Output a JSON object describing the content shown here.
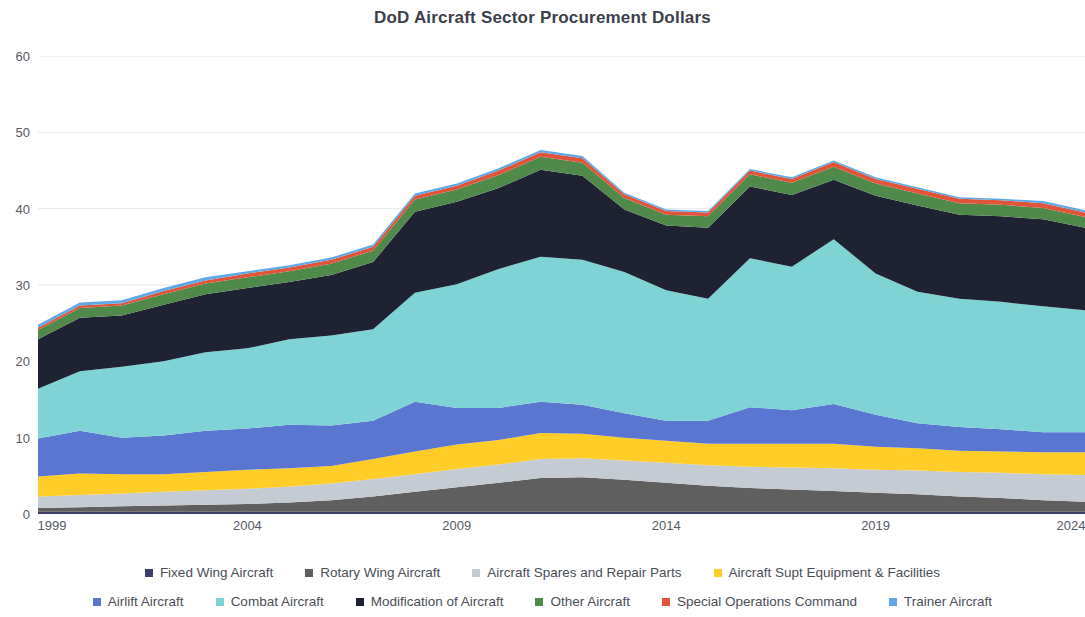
{
  "chart_data": {
    "type": "area",
    "stacked": true,
    "title": "DoD Aircraft Sector Procurement Dollars",
    "xlabel": "",
    "ylabel": "",
    "xlim": [
      1999,
      2024
    ],
    "ylim": [
      0,
      60
    ],
    "ytick_step": 10,
    "grid": true,
    "grid_axis": "y",
    "legend_position": "bottom",
    "x": [
      1999,
      2000,
      2001,
      2002,
      2003,
      2004,
      2005,
      2006,
      2007,
      2008,
      2009,
      2010,
      2011,
      2012,
      2013,
      2014,
      2015,
      2016,
      2017,
      2018,
      2019,
      2020,
      2021,
      2022,
      2023,
      2024
    ],
    "xticks": [
      "1999",
      "2004",
      "2009",
      "2014",
      "2019",
      "2024"
    ],
    "yticks": [
      "0",
      "10",
      "20",
      "30",
      "40",
      "50",
      "60"
    ],
    "series": [
      {
        "name": "Fixed Wing Aircraft",
        "color": "#3E3E6B",
        "values": [
          0.3,
          0.3,
          0.3,
          0.3,
          0.3,
          0.3,
          0.3,
          0.3,
          0.3,
          0.3,
          0.3,
          0.3,
          0.3,
          0.3,
          0.3,
          0.3,
          0.3,
          0.3,
          0.3,
          0.3,
          0.3,
          0.3,
          0.3,
          0.3,
          0.3,
          0.3
        ]
      },
      {
        "name": "Rotary Wing Aircraft",
        "color": "#5F5F5F",
        "values": [
          0.5,
          0.6,
          0.7,
          0.8,
          0.9,
          1.0,
          1.2,
          1.5,
          2.0,
          2.6,
          3.2,
          3.8,
          4.4,
          4.5,
          4.2,
          3.8,
          3.4,
          3.1,
          2.9,
          2.7,
          2.5,
          2.3,
          2.0,
          1.8,
          1.5,
          1.3
        ]
      },
      {
        "name": "Aircraft Spares and Repair Parts",
        "color": "#C5CBD2",
        "values": [
          1.5,
          1.6,
          1.7,
          1.8,
          1.9,
          2.0,
          2.1,
          2.2,
          2.3,
          2.3,
          2.4,
          2.4,
          2.5,
          2.5,
          2.5,
          2.6,
          2.7,
          2.8,
          2.9,
          3.0,
          3.0,
          3.1,
          3.2,
          3.3,
          3.4,
          3.5
        ]
      },
      {
        "name": "Aircraft Supt Equipment & Facilities",
        "color": "#FFCC28",
        "values": [
          2.6,
          2.8,
          2.5,
          2.3,
          2.4,
          2.5,
          2.4,
          2.3,
          2.6,
          3.0,
          3.2,
          3.2,
          3.4,
          3.2,
          3.0,
          2.9,
          2.8,
          3.0,
          3.1,
          3.2,
          3.0,
          2.9,
          2.8,
          2.8,
          2.9,
          3.0
        ]
      },
      {
        "name": "Airlift Aircraft",
        "color": "#5B76D0",
        "values": [
          5.0,
          5.6,
          4.8,
          5.1,
          5.4,
          5.4,
          5.7,
          5.3,
          5.0,
          6.5,
          4.8,
          4.2,
          4.1,
          3.8,
          3.2,
          2.6,
          3.0,
          4.8,
          4.4,
          5.2,
          4.2,
          3.3,
          3.1,
          2.9,
          2.6,
          2.6
        ]
      },
      {
        "name": "Combat Aircraft",
        "color": "#7ED4D4",
        "values": [
          6.5,
          7.8,
          9.3,
          9.7,
          10.3,
          10.5,
          11.2,
          11.8,
          12.0,
          14.3,
          16.2,
          18.2,
          19.0,
          19.0,
          18.5,
          17.1,
          16.0,
          19.5,
          18.8,
          21.6,
          18.5,
          17.2,
          16.8,
          16.7,
          16.5,
          16.0
        ]
      },
      {
        "name": "Modification of Aircraft",
        "color": "#1E2233",
        "values": [
          6.5,
          7.0,
          6.7,
          7.4,
          7.6,
          7.9,
          7.5,
          7.9,
          8.8,
          10.6,
          10.8,
          10.6,
          11.4,
          11.0,
          8.2,
          8.5,
          9.3,
          9.4,
          9.4,
          7.8,
          10.2,
          11.3,
          11.0,
          11.2,
          11.4,
          10.8
        ]
      },
      {
        "name": "Other Aircraft",
        "color": "#4F8A4A",
        "values": [
          1.2,
          1.3,
          1.3,
          1.4,
          1.4,
          1.4,
          1.4,
          1.5,
          1.5,
          1.6,
          1.6,
          1.7,
          1.7,
          1.7,
          1.5,
          1.4,
          1.5,
          1.6,
          1.6,
          1.7,
          1.6,
          1.6,
          1.5,
          1.5,
          1.5,
          1.4
        ]
      },
      {
        "name": "Special Operations Command",
        "color": "#E0553A",
        "values": [
          0.3,
          0.3,
          0.3,
          0.4,
          0.4,
          0.5,
          0.5,
          0.5,
          0.5,
          0.5,
          0.5,
          0.6,
          0.6,
          0.6,
          0.5,
          0.5,
          0.5,
          0.5,
          0.5,
          0.6,
          0.6,
          0.6,
          0.6,
          0.6,
          0.6,
          0.6
        ]
      },
      {
        "name": "Trainer Aircraft",
        "color": "#5FA8E8",
        "values": [
          0.4,
          0.4,
          0.4,
          0.4,
          0.4,
          0.3,
          0.3,
          0.3,
          0.3,
          0.3,
          0.3,
          0.3,
          0.3,
          0.3,
          0.2,
          0.2,
          0.2,
          0.2,
          0.2,
          0.2,
          0.2,
          0.2,
          0.2,
          0.2,
          0.3,
          0.3
        ]
      }
    ]
  },
  "legend": {
    "row1": [
      {
        "label": "Fixed Wing Aircraft",
        "color": "#3E3E6B"
      },
      {
        "label": "Rotary Wing Aircraft",
        "color": "#5F5F5F"
      },
      {
        "label": "Aircraft Spares and Repair Parts",
        "color": "#C5CBD2"
      },
      {
        "label": "Aircraft Supt Equipment & Facilities",
        "color": "#FFCC28"
      }
    ],
    "row2": [
      {
        "label": "Airlift Aircraft",
        "color": "#5B76D0"
      },
      {
        "label": "Combat Aircraft",
        "color": "#7ED4D4"
      },
      {
        "label": "Modification of Aircraft",
        "color": "#1E2233"
      },
      {
        "label": "Other Aircraft",
        "color": "#4F8A4A"
      },
      {
        "label": "Special Operations Command",
        "color": "#E0553A"
      },
      {
        "label": "Trainer Aircraft",
        "color": "#5FA8E8"
      }
    ]
  }
}
